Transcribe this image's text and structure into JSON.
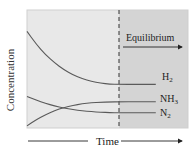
{
  "chart_data": {
    "type": "line",
    "title": "",
    "xlabel": "Time",
    "ylabel": "Concentration",
    "grid": false,
    "legend": "inline labels at right end of lines",
    "annotation": {
      "text": "Equilibrium",
      "arrow": "right",
      "region": "shaded right of dashed line"
    },
    "x": [
      0,
      0.1,
      0.2,
      0.3,
      0.4,
      0.5,
      0.6,
      0.7,
      0.8,
      0.9,
      1.0,
      1.2,
      1.4
    ],
    "equilibrium_x": 1.0,
    "series": [
      {
        "name": "H2",
        "label": "H",
        "sub": "2",
        "values": [
          0.92,
          0.8,
          0.7,
          0.62,
          0.555,
          0.505,
          0.47,
          0.445,
          0.428,
          0.418,
          0.415,
          0.415,
          0.415
        ]
      },
      {
        "name": "NH3",
        "label": "NH",
        "sub": "3",
        "values": [
          0.02,
          0.08,
          0.125,
          0.165,
          0.195,
          0.215,
          0.23,
          0.24,
          0.245,
          0.248,
          0.25,
          0.25,
          0.25
        ]
      },
      {
        "name": "N2",
        "label": "N",
        "sub": "2",
        "values": [
          0.3,
          0.265,
          0.235,
          0.21,
          0.19,
          0.175,
          0.163,
          0.155,
          0.15,
          0.147,
          0.145,
          0.145,
          0.145
        ]
      }
    ],
    "ylim": [
      0,
      1
    ],
    "colors": {
      "plot_bg": "#e6e6e6",
      "equilibrium_bg": "#d3d3d3",
      "line": "#555555",
      "text": "#222222",
      "border": "#c8c8c8"
    }
  },
  "labels": {
    "ylabel": "Concentration",
    "xlabel": "Time",
    "equilibrium": "Equilibrium",
    "h2_main": "H",
    "h2_sub": "2",
    "nh3_main": "NH",
    "nh3_sub": "3",
    "n2_main": "N",
    "n2_sub": "2"
  }
}
